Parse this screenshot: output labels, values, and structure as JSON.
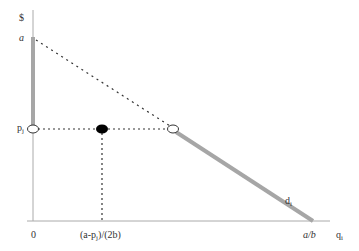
{
  "diagram": {
    "axes": {
      "y_label": "$",
      "x_label": "q",
      "x_label_sub": "i"
    },
    "y_ticks": {
      "a": "a",
      "p": "p",
      "p_sub": "j"
    },
    "x_ticks": {
      "zero": "0",
      "mid": "(a-p",
      "mid_sub": "j",
      "mid_tail": ")/(2b)",
      "end": "a/b"
    },
    "curve_label": "d",
    "curve_label_sub": "i",
    "colors": {
      "axis": "#999999",
      "demand_line": "#a6a6a6",
      "dotted": "#333333",
      "filled_point": "#000000"
    }
  }
}
